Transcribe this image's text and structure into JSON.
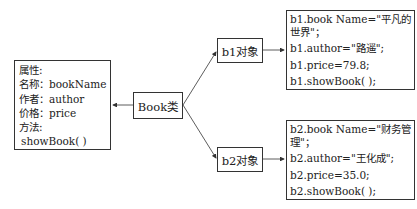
{
  "attributes_box": {
    "lines": [
      "属性:",
      "名称：bookName",
      "作者：author",
      "价格：price",
      "方法:",
      " showBook( )"
    ]
  },
  "class_box": {
    "label": "Book类"
  },
  "objects": [
    {
      "label": "b1对象",
      "details": [
        "b1.book Name=\"平凡的",
        "世界\"；",
        "b1.author=\"路遥\";",
        "b1.price=79.8;",
        "b1.showBook( );"
      ]
    },
    {
      "label": "b2对象",
      "details": [
        "b2.book Name=\"财务管",
        "理\"；",
        "b2.author=\"王化成\";",
        "b2.price=35.0;",
        "b2.showBook( );"
      ]
    }
  ]
}
